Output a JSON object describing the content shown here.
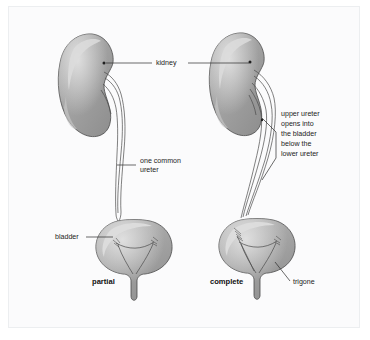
{
  "figure": {
    "background_color": "#fbfbfc",
    "page_color": "#ffffff",
    "border_color": "#eceef0",
    "organ_fill": "#a3a3a3",
    "organ_fill_dark": "#8e8e8e",
    "organ_highlight": "#d6d6d6",
    "outline_color": "#4a4a4a",
    "text_color": "#1b1b1b"
  },
  "labels": {
    "kidney": "kidney",
    "one_common_ureter_line1": "one common",
    "one_common_ureter_line2": "ureter",
    "bladder": "bladder",
    "trigone": "trigone",
    "upper_ureter_note": [
      "upper ureter",
      "opens into",
      "the bladder",
      "below the",
      "lower ureter"
    ]
  },
  "captions": {
    "left": "partial",
    "right": "complete"
  },
  "panels": [
    {
      "name": "partial-duplication",
      "caption": "partial",
      "kidney_label": "kidney",
      "ureter_label": "one common ureter",
      "bladder_label": "bladder",
      "ureter_count_at_bladder": 1
    },
    {
      "name": "complete-duplication",
      "caption": "complete",
      "kidney_label": "kidney",
      "note": "upper ureter opens into the bladder below the lower ureter",
      "trigone_label": "trigone",
      "ureter_count_at_bladder": 2
    }
  ]
}
